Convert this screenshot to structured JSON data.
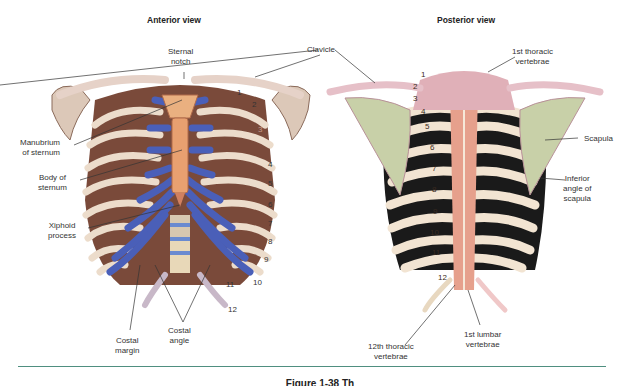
{
  "anterior": {
    "title": "Anterior view",
    "labels": {
      "sternal_notch": "Sternal\nnotch",
      "manubrium": "Manubrium\nof sternum",
      "body_of_sternum": "Body of\nsternum",
      "xiphoid": "Xiphoid\nprocess",
      "costal_margin": "Costal\nmargin",
      "costal_angle": "Costal\nangle"
    },
    "rib_numbers": [
      "1",
      "2",
      "3",
      "4",
      "5",
      "6",
      "7",
      "8",
      "9",
      "10",
      "11",
      "12"
    ]
  },
  "shared": {
    "clavicle": "Clavicle"
  },
  "posterior": {
    "title": "Posterior view",
    "labels": {
      "first_thoracic": "1st thoracic\nvertebrae",
      "scapula": "Scapula",
      "inferior_angle": "Inferior\nangle of\nscapula",
      "twelfth_thoracic": "12th thoracic\nvertebrae",
      "first_lumbar": "1st lumbar\nvertebrae"
    },
    "rib_numbers": [
      "1",
      "2",
      "3",
      "4",
      "5",
      "6",
      "7",
      "8",
      "9",
      "10",
      "11",
      "12"
    ]
  },
  "caption": "Figure 1-38  Th",
  "colors": {
    "divider": "#4f8f80",
    "cartilage_blue": "#4a5fb8",
    "sternum_orange": "#e8a070",
    "bone_cream": "#ecdccb",
    "muscle_brown": "#7a4a3a",
    "posterior_pink": "#e0a8a8",
    "scapula_green": "#c8d0a8"
  }
}
